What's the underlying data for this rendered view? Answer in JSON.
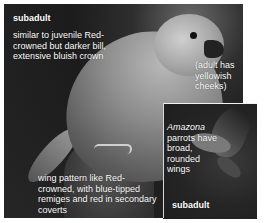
{
  "figure": {
    "subject": "parrot",
    "main_photo": {
      "caption_title": "subadult",
      "description": "similar to juvenile Red-crowned but darker bill, extensive bluish crown",
      "note_cheeks": "(adult has yellowish cheeks)",
      "wing_note": "wing pattern like Red-crowned, with blue-tipped remiges and red in secondary coverts"
    },
    "inset_photo": {
      "genus": "Amazona",
      "note_rest": "parrots have broad, rounded wings",
      "caption_title": "subadult"
    }
  }
}
